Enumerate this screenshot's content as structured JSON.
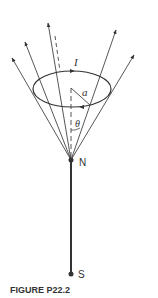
{
  "figure": {
    "caption": "FIGURE P22.2",
    "labels": {
      "current": "I",
      "radius": "a",
      "angle": "θ",
      "north": "N",
      "south": "S"
    },
    "colors": {
      "ink": "#333333",
      "background": "#ffffff"
    }
  }
}
